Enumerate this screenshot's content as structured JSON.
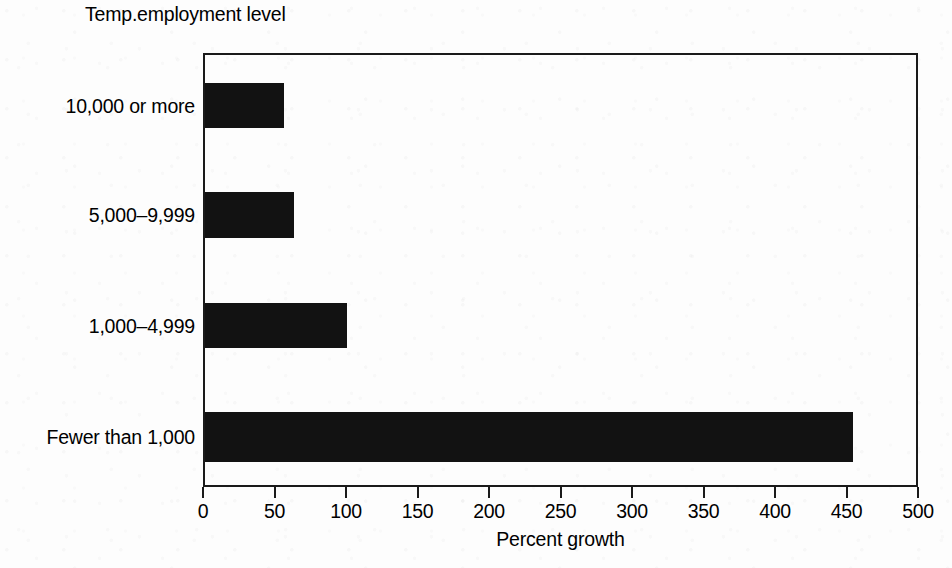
{
  "chart_data": {
    "type": "bar",
    "orientation": "horizontal",
    "title": "Temp.employment level",
    "xlabel": "Percent growth",
    "ylabel": "",
    "categories": [
      "10,000 or more",
      "5,000–9,999",
      "1,000–4,999",
      "Fewer than 1,000"
    ],
    "values": [
      55,
      62,
      99,
      453
    ],
    "xlim": [
      0,
      500
    ],
    "xticks": [
      0,
      50,
      100,
      150,
      200,
      250,
      300,
      350,
      400,
      450,
      500
    ],
    "xtick_labels": [
      "0",
      "50",
      "100",
      "150",
      "200",
      "250",
      "300",
      "350",
      "400",
      "450",
      "500"
    ],
    "grid": false,
    "legend": false,
    "bar_color": "#121212",
    "axis_color": "#1a1a1a",
    "background_color": "#fdfdfd"
  },
  "bars": [
    {
      "label": "10,000 or more",
      "value": 55,
      "top_px": 83,
      "height_px": 45
    },
    {
      "label": "5,000–9,999",
      "value": 62,
      "top_px": 192,
      "height_px": 46
    },
    {
      "label": "1,000–4,999",
      "value": 99,
      "top_px": 303,
      "height_px": 45
    },
    {
      "label": "Fewer than 1,000",
      "value": 453,
      "top_px": 412,
      "height_px": 50
    }
  ]
}
